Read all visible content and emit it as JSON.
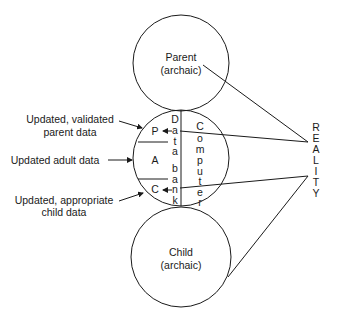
{
  "diagram": {
    "parent_circle": {
      "line1": "Parent",
      "line2": "(archaic)"
    },
    "child_circle": {
      "line1": "Child",
      "line2": "(archaic)"
    },
    "adult_circle": {
      "sections": {
        "parent": "P",
        "adult": "A",
        "child": "C"
      },
      "data_bank_letters": [
        "D",
        "a",
        "t",
        "a",
        "b",
        "a",
        "n",
        "k"
      ],
      "computer_letters": [
        "C",
        "o",
        "m",
        "p",
        "u",
        "t",
        "e",
        "r"
      ]
    },
    "left_labels": {
      "parent_data": {
        "line1": "Updated, validated",
        "line2": "parent data"
      },
      "adult_data": {
        "line1": "Updated adult data"
      },
      "child_data": {
        "line1": "Updated, appropriate",
        "line2": "child data"
      }
    },
    "reality_letters": [
      "R",
      "E",
      "A",
      "L",
      "I",
      "T",
      "Y"
    ]
  }
}
